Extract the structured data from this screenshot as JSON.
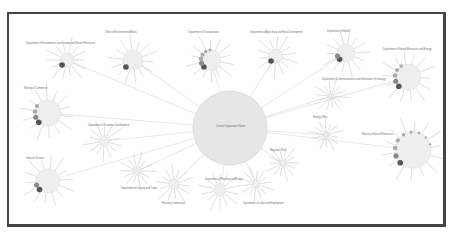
{
  "diagram": {
    "type": "radial-network",
    "center": {
      "label": "Central Organization Name",
      "x": 230,
      "y": 128,
      "r": 37
    },
    "edge_color": "#dcdcdc",
    "node_fill": "#eeeeee",
    "dot_colors": [
      "#555555",
      "#888888",
      "#aaaaaa"
    ],
    "nodes": [
      {
        "label": "Department of Environment Conservation and Natural Resources",
        "x": 67,
        "y": 60,
        "r": 7,
        "lx": 26,
        "ly": 42,
        "dots": 1
      },
      {
        "label": "Office of Environmental Affairs",
        "x": 133,
        "y": 60,
        "r": 10,
        "lx": 105,
        "ly": 31,
        "dots": 1
      },
      {
        "label": "Department of Transportation",
        "x": 211,
        "y": 60,
        "r": 10,
        "lx": 188,
        "ly": 31,
        "dots": 6
      },
      {
        "label": "Department of Agriculture and Rural Development",
        "x": 276,
        "y": 56,
        "r": 7,
        "lx": 250,
        "ly": 31,
        "dots": 1
      },
      {
        "label": "Department of Health",
        "x": 346,
        "y": 53,
        "r": 9,
        "lx": 327,
        "ly": 30,
        "dots": 2
      },
      {
        "label": "Department of Natural Resources and Energy",
        "x": 408,
        "y": 77,
        "r": 13,
        "lx": 383,
        "ly": 48,
        "dots": 5
      },
      {
        "label": "Ministry of Commerce",
        "x": 48,
        "y": 113,
        "r": 13,
        "lx": 24,
        "ly": 87,
        "dots": 4
      },
      {
        "label": "Department of Economic Development",
        "x": 104,
        "y": 141,
        "r": 5,
        "lx": 88,
        "ly": 124,
        "dots": 0
      },
      {
        "label": "General Services",
        "x": 48,
        "y": 181,
        "r": 12,
        "lx": 26,
        "ly": 157,
        "dots": 2
      },
      {
        "label": "Department of Industry and Trade",
        "x": 137,
        "y": 171,
        "r": 4,
        "lx": 121,
        "ly": 187,
        "dots": 0
      },
      {
        "label": "Planning Commission",
        "x": 174,
        "y": 184,
        "r": 5,
        "lx": 162,
        "ly": 202,
        "dots": 0
      },
      {
        "label": "Department of Planning and Budget",
        "x": 220,
        "y": 190,
        "r": 6,
        "lx": 205,
        "ly": 178,
        "dots": 0
      },
      {
        "label": "Department of Labor and Employment",
        "x": 256,
        "y": 184,
        "r": 3,
        "lx": 243,
        "ly": 202,
        "dots": 0
      },
      {
        "label": "Regional Office",
        "x": 283,
        "y": 163,
        "r": 3,
        "lx": 270,
        "ly": 149,
        "dots": 0
      },
      {
        "label": "Department of Communications and Information Technology",
        "x": 331,
        "y": 96,
        "r": 2,
        "lx": 322,
        "ly": 78,
        "dots": 0
      },
      {
        "label": "Energy Office",
        "x": 326,
        "y": 135,
        "r": 2,
        "lx": 313,
        "ly": 116,
        "dots": 0
      },
      {
        "label": "Ministry of Natural Resources",
        "x": 413,
        "y": 150,
        "r": 18,
        "lx": 362,
        "ly": 133,
        "dots": 9
      }
    ]
  }
}
